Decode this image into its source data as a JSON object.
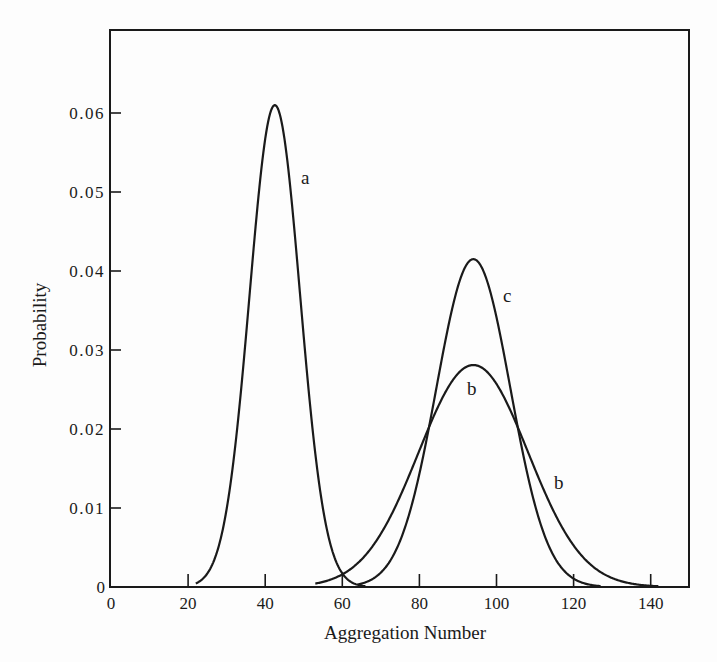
{
  "chart_data": {
    "type": "line",
    "title": "",
    "xlabel": "Aggregation Number",
    "ylabel": "Probability",
    "xlim": [
      0,
      150
    ],
    "ylim": [
      0,
      0.0705
    ],
    "grid": false,
    "legend": "none (curves labeled inline)",
    "x_ticks": [
      0,
      20,
      40,
      60,
      80,
      100,
      120,
      140
    ],
    "x_tick_labels": [
      "0",
      "20",
      "40",
      "60",
      "80",
      "100",
      "120",
      "140"
    ],
    "y_ticks": [
      0,
      0.01,
      0.02,
      0.03,
      0.04,
      0.05,
      0.06
    ],
    "y_tick_labels": [
      "0",
      "0.01",
      "0.02",
      "0.03",
      "0.04",
      "0.05",
      "0.06"
    ],
    "series": [
      {
        "name": "a",
        "shape": "gaussian",
        "mean": 42.5,
        "sigma": 6.55,
        "peak": 0.061,
        "x_range": [
          22,
          66
        ],
        "label_position": {
          "x": 50.5,
          "y": 0.052
        },
        "points": [
          [
            23,
            0
          ],
          [
            30,
            0.0099
          ],
          [
            35,
            0.0317
          ],
          [
            40,
            0.0568
          ],
          [
            42.5,
            0.061
          ],
          [
            45,
            0.0568
          ],
          [
            50,
            0.0317
          ],
          [
            55,
            0.0099
          ],
          [
            60,
            0.0017
          ],
          [
            65,
            0.0001
          ]
        ]
      },
      {
        "name": "b",
        "shape": "gaussian",
        "mean": 94,
        "sigma": 14.2,
        "peak": 0.0281,
        "x_range": [
          53,
          142
        ],
        "label_position_inner": {
          "x": 94,
          "y": 0.0245
        },
        "label_position_outer": {
          "x": 116.5,
          "y": 0.0125
        },
        "points": [
          [
            54,
            0.0005
          ],
          [
            60,
            0.0015
          ],
          [
            70,
            0.0067
          ],
          [
            80,
            0.0173
          ],
          [
            90,
            0.027
          ],
          [
            94,
            0.0281
          ],
          [
            100,
            0.0256
          ],
          [
            110,
            0.0148
          ],
          [
            120,
            0.0053
          ],
          [
            130,
            0.0012
          ],
          [
            140,
            0.0002
          ]
        ]
      },
      {
        "name": "c",
        "shape": "gaussian",
        "mean": 94,
        "sigma": 9.6,
        "peak": 0.0415,
        "x_range": [
          64,
          127
        ],
        "label_position": {
          "x": 103.5,
          "y": 0.0365
        },
        "points": [
          [
            65,
            0.0004
          ],
          [
            70,
            0.0018
          ],
          [
            80,
            0.0145
          ],
          [
            90,
            0.0379
          ],
          [
            94,
            0.0415
          ],
          [
            100,
            0.0341
          ],
          [
            110,
            0.0103
          ],
          [
            120,
            0.001
          ],
          [
            126,
            0.0001
          ]
        ]
      }
    ],
    "annotations": [
      "a",
      "b",
      "b",
      "c"
    ]
  },
  "labels": {
    "xlabel": "Aggregation Number",
    "ylabel": "Probability",
    "curve_a": "a",
    "curve_b_inner": "b",
    "curve_b_outer": "b",
    "curve_c": "c"
  },
  "style": {
    "line_color": "#1a1a1a",
    "background": "#fdfdfd"
  }
}
